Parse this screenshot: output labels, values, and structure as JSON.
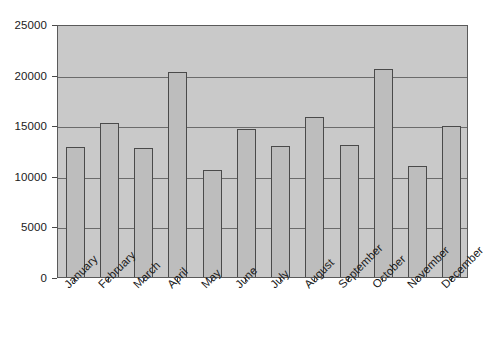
{
  "chart_data": {
    "type": "bar",
    "title": "",
    "subtitle": "",
    "xlabel": "",
    "ylabel": "",
    "categories": [
      "January",
      "February",
      "March",
      "April",
      "May",
      "June",
      "July",
      "August",
      "September",
      "October",
      "November",
      "December"
    ],
    "values": [
      12800,
      15200,
      12700,
      20300,
      10600,
      14600,
      12900,
      15800,
      13000,
      20600,
      11000,
      14900
    ],
    "series": [
      {
        "name": "",
        "values": [
          12800,
          15200,
          12700,
          20300,
          10600,
          14600,
          12900,
          15800,
          13000,
          20600,
          11000,
          14900
        ]
      }
    ],
    "ylim": [
      0,
      25000
    ],
    "ytick_labels": [
      "0",
      "5000",
      "10000",
      "15000",
      "20000",
      "25000"
    ],
    "ytick_values": [
      0,
      5000,
      10000,
      15000,
      20000,
      25000
    ],
    "grid": true,
    "grid_axis": "y",
    "legend": null,
    "legend_position": "none",
    "xtick_rotation": -45,
    "colors": {
      "plot_background": "#c9c9c9",
      "bar_fill": "#bdbdbd",
      "bar_edge": "#4a4a4a",
      "gridline": "#6b6b6b",
      "axis": "#5a5a5a",
      "text": "#1a1a1a",
      "figure_background": "#ffffff"
    }
  }
}
